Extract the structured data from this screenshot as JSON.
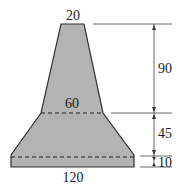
{
  "diagram": {
    "type": "cross-section dimension drawing",
    "shape_fill": "#b3b3b3",
    "stroke_color": "#333333",
    "widths": {
      "top": "20",
      "middle": "60",
      "bottom": "120"
    },
    "heights": {
      "upper": "90",
      "middle": "45",
      "base": "10"
    }
  }
}
